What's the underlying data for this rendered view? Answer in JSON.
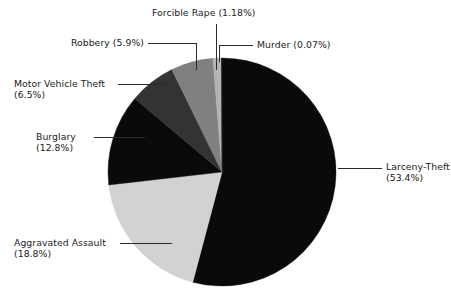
{
  "chart_data": {
    "type": "pie",
    "title": "",
    "subtitle": "",
    "xlabel": "",
    "ylabel": "",
    "legend_position": "none",
    "grid": false,
    "labels_show_percent": true,
    "start_angle_deg": 0,
    "direction": "clockwise",
    "categories": [
      "Larceny-Theft",
      "Aggravated Assault",
      "Burglary",
      "Motor Vehicle Theft",
      "Robbery",
      "Forcible Rape",
      "Murder"
    ],
    "values": [
      53.4,
      18.8,
      12.8,
      6.5,
      5.9,
      1.18,
      0.07
    ],
    "slices": [
      {
        "name": "Larceny-Theft",
        "percent": 53.4,
        "label": "Larceny-Theft",
        "percent_label": "(53.4%)",
        "color": "#0a0a0a"
      },
      {
        "name": "Aggravated Assault",
        "percent": 18.8,
        "label": "Aggravated Assault",
        "percent_label": "(18.8%)",
        "color": "#d2d2d2"
      },
      {
        "name": "Burglary",
        "percent": 12.8,
        "label": "Burglary",
        "percent_label": "(12.8%)",
        "color": "#0a0a0a"
      },
      {
        "name": "Motor Vehicle Theft",
        "percent": 6.5,
        "label": "Motor Vehicle Theft",
        "percent_label": "(6.5%)",
        "color": "#333333"
      },
      {
        "name": "Robbery",
        "percent": 5.9,
        "label": "Robbery",
        "percent_label": "(5.9%)",
        "color": "#808080"
      },
      {
        "name": "Forcible Rape",
        "percent": 1.18,
        "label": "Forcible Rape",
        "percent_label": "(1.18%)",
        "color": "#b4b4b4"
      },
      {
        "name": "Murder",
        "percent": 0.07,
        "label": "Murder",
        "percent_label": "(0.07%)",
        "color": "#0a0a0a"
      }
    ]
  },
  "labels": {
    "forcible_rape": "Forcible Rape (1.18%)",
    "murder": "Murder (0.07%)",
    "robbery": "Robbery (5.9%)",
    "motor_vehicle_theft_line1": "Motor Vehicle Theft",
    "motor_vehicle_theft_line2": "(6.5%)",
    "burglary_line1": "Burglary",
    "burglary_line2": "(12.8%)",
    "aggravated_assault_line1": "Aggravated Assault",
    "aggravated_assault_line2": "(18.8%)",
    "larceny_theft_line1": "Larceny-Theft",
    "larceny_theft_line2": "(53.4%)"
  },
  "colors": {
    "background": "#ffffff",
    "text": "#1b1b1b",
    "leader_line": "#2b2b2b",
    "slice_black": "#0a0a0a",
    "slice_dark_gray": "#333333",
    "slice_mid_gray": "#808080",
    "slice_light_gray": "#b4b4b4",
    "slice_pale_gray": "#d2d2d2"
  }
}
